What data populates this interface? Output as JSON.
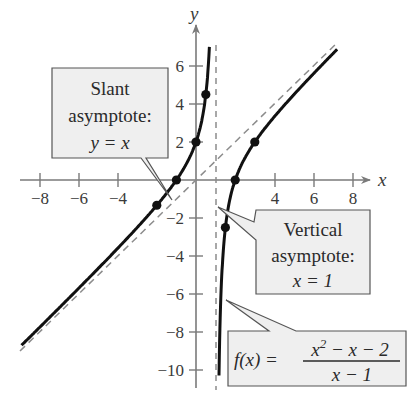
{
  "chart_data": {
    "type": "line",
    "title": "",
    "xlabel": "x",
    "ylabel": "y",
    "xlim": [
      -9,
      9
    ],
    "ylim": [
      -11,
      7
    ],
    "grid": false,
    "x_ticks": [
      -8,
      -6,
      -4,
      4,
      6,
      8
    ],
    "y_ticks": [
      6,
      4,
      2,
      -2,
      -4,
      -6,
      -8,
      -10
    ],
    "x_tick_labels": [
      "−8",
      "−6",
      "−4",
      "4",
      "6",
      "8"
    ],
    "y_tick_labels": [
      "6",
      "4",
      "2",
      "−2",
      "−4",
      "−6",
      "−8",
      "−10"
    ],
    "function": "f(x) = (x^2 - x - 2)/(x - 1)",
    "series": [
      {
        "name": "f(x) left branch",
        "style": "solid",
        "domain": [
          -8.9,
          0.98
        ]
      },
      {
        "name": "f(x) right branch",
        "style": "solid",
        "domain": [
          1.02,
          7.2
        ]
      },
      {
        "name": "Slant asymptote y = x",
        "style": "dashed",
        "x": [
          -9,
          7.2
        ],
        "y": [
          -9,
          7.2
        ]
      },
      {
        "name": "Vertical asymptote x = 1",
        "style": "dashed",
        "x": [
          1,
          1
        ],
        "y": [
          -11,
          7
        ]
      }
    ],
    "points": [
      {
        "x": -2,
        "y": -1.33
      },
      {
        "x": -1,
        "y": 0
      },
      {
        "x": 0,
        "y": 2
      },
      {
        "x": 0.5,
        "y": 4.5
      },
      {
        "x": 1.5,
        "y": -2.5
      },
      {
        "x": 2,
        "y": 0
      },
      {
        "x": 3,
        "y": 2
      }
    ],
    "annotations": [
      {
        "id": "slant",
        "lines": [
          "Slant",
          "asymptote:",
          "y = x"
        ]
      },
      {
        "id": "vertical",
        "lines": [
          "Vertical",
          "asymptote:",
          "x = 1"
        ]
      },
      {
        "id": "function",
        "lhs": "f(x) =",
        "numerator": "x² − x − 2",
        "denominator": "x − 1"
      }
    ]
  },
  "labels": {
    "x_axis": "x",
    "y_axis": "y",
    "slant_line1": "Slant",
    "slant_line2": "asymptote:",
    "slant_line3": "y = x",
    "vertical_line1": "Vertical",
    "vertical_line2": "asymptote:",
    "vertical_line3": "x = 1",
    "func_lhs": "f(x) =",
    "func_num_a": "x",
    "func_num_exp": "2",
    "func_num_b": " − x − 2",
    "func_den": "x − 1"
  },
  "colors": {
    "axis": "#7a7a7a",
    "curve": "#111111",
    "dash": "#8c8c8c",
    "box_fill": "#efefef",
    "box_stroke": "#555555"
  }
}
